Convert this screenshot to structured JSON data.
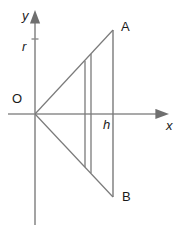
{
  "figure": {
    "type": "line-diagram",
    "canvas": {
      "width": 180,
      "height": 234,
      "background": "#ffffff"
    },
    "stroke_color": "#7a7a7a",
    "axis_color": "#8c8c8c",
    "label_color": "#1a1a1a",
    "axes": {
      "x_axis": {
        "label": "x",
        "label_style": "italic",
        "arrow": "right",
        "start_px": [
          8,
          114
        ],
        "end_px": [
          163,
          114
        ]
      },
      "y_axis": {
        "label": "y",
        "label_style": "italic",
        "arrow": "up",
        "start_px": [
          35,
          225
        ],
        "end_px": [
          35,
          18
        ]
      },
      "origin": {
        "label": "O",
        "label_style": "upright",
        "point_px": [
          35,
          114
        ]
      }
    },
    "ticks": [
      {
        "name": "r",
        "label": "r",
        "label_style": "italic",
        "axis": "y",
        "position_px": [
          35,
          45
        ]
      },
      {
        "name": "h",
        "label": "h",
        "label_style": "italic",
        "axis": "x",
        "position_px": [
          113,
          114
        ]
      }
    ],
    "points": [
      {
        "name": "A",
        "label": "A",
        "label_style": "upright",
        "position_px": [
          113,
          30
        ]
      },
      {
        "name": "B",
        "label": "B",
        "label_style": "upright",
        "position_px": [
          113,
          197
        ]
      }
    ],
    "segments": [
      {
        "name": "segment-OA",
        "from_px": [
          35,
          114
        ],
        "to_px": [
          113,
          30
        ]
      },
      {
        "name": "segment-OB",
        "from_px": [
          35,
          114
        ],
        "to_px": [
          113,
          197
        ]
      },
      {
        "name": "segment-AB",
        "from_px": [
          113,
          30
        ],
        "to_px": [
          113,
          197
        ]
      },
      {
        "name": "inner-chord-1",
        "from_px": [
          85,
          61
        ],
        "to_px": [
          85,
          167
        ]
      },
      {
        "name": "inner-chord-2",
        "from_px": [
          91,
          54
        ],
        "to_px": [
          91,
          173
        ]
      }
    ]
  }
}
